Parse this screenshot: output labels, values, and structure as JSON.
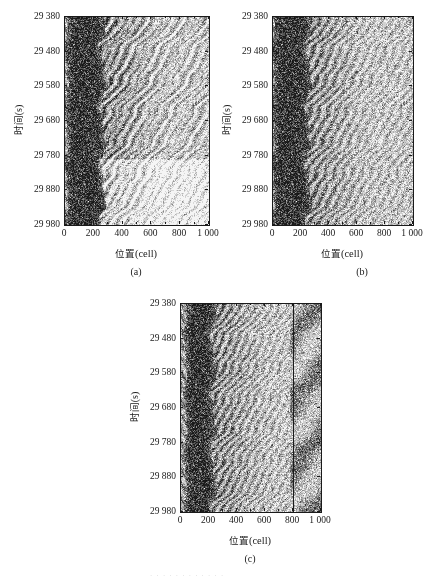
{
  "figure": {
    "panels": [
      {
        "id": "a",
        "caption": "(a)",
        "vline": null
      },
      {
        "id": "b",
        "caption": "(b)",
        "vline": null
      },
      {
        "id": "c",
        "caption": "(c)",
        "vline": 800
      }
    ],
    "axis": {
      "x_title_cn": "位置",
      "x_title_unit": "(cell)",
      "y_title_cn": "时间",
      "y_title_unit": "(s)",
      "x_ticks": [
        "0",
        "200",
        "400",
        "600",
        "800",
        "1 000"
      ],
      "x_tick_values": [
        0,
        200,
        400,
        600,
        800,
        1000
      ],
      "y_ticks": [
        "29 380",
        "29 480",
        "29 580",
        "29 680",
        "29 780",
        "29 880",
        "29 980"
      ],
      "y_tick_values": [
        29380,
        29480,
        29580,
        29680,
        29780,
        29880,
        29980
      ]
    }
  },
  "chart_data": [
    {
      "type": "heatmap",
      "panel": "a",
      "title": "(a)",
      "xlabel": "位置(cell)",
      "ylabel": "时间(s)",
      "xlim": [
        0,
        1000
      ],
      "ylim": [
        29380,
        29980
      ],
      "y_inverted": true,
      "grid": false,
      "legend": "none",
      "colormap": "grayscale",
      "value_meaning": "vehicle occupancy / density (dark = congested jam, light = free flow)",
      "xticks": [
        0,
        200,
        400,
        600,
        800,
        1000
      ],
      "yticks": [
        29380,
        29480,
        29580,
        29680,
        29780,
        29880,
        29980
      ],
      "features": {
        "jam_band_x_range": [
          40,
          260
        ],
        "jam_band_description": "dense dark stop-and-go cluster oscillating between cell 40 and cell 260 over the whole time window",
        "downstream_front_x": 265,
        "wave_direction": "backward-propagating (upstream) jam waves with forward-inclined free-flow stripes downstream",
        "free_flow_region_x_range": [
          300,
          1000
        ],
        "notable_light_bands_t": [
          29560,
          29680,
          29800,
          29880
        ],
        "texture_density_right": "medium-dark speckle above t=29790, light speckle below"
      }
    },
    {
      "type": "heatmap",
      "panel": "b",
      "title": "(b)",
      "xlabel": "位置(cell)",
      "ylabel": "时间(s)",
      "xlim": [
        0,
        1000
      ],
      "ylim": [
        29380,
        29980
      ],
      "y_inverted": true,
      "grid": false,
      "legend": "none",
      "colormap": "grayscale",
      "value_meaning": "vehicle occupancy / density (dark = congested jam, light = free flow)",
      "xticks": [
        0,
        200,
        400,
        600,
        800,
        1000
      ],
      "yticks": [
        29380,
        29480,
        29580,
        29680,
        29780,
        29880,
        29980
      ],
      "features": {
        "jam_band_x_range": [
          30,
          250
        ],
        "jam_band_description": "solid black vertical congestion column from cell 30 to 250 persisting across all times",
        "downstream_front_x": 255,
        "wave_direction": "regular periodic backward waves fanning right from the jam edge",
        "free_flow_region_x_range": [
          300,
          1000
        ],
        "stripe_period_s": 40,
        "texture_density_right": "uniform medium speckle, lighter diagonal stripes every ~40 s"
      }
    },
    {
      "type": "heatmap",
      "panel": "c",
      "title": "(c)",
      "xlabel": "位置(cell)",
      "ylabel": "时间(s)",
      "xlim": [
        0,
        1000
      ],
      "ylim": [
        29380,
        29980
      ],
      "y_inverted": true,
      "grid": false,
      "legend": "none",
      "colormap": "grayscale",
      "value_meaning": "vehicle occupancy / density (dark = congested jam, light = free flow)",
      "xticks": [
        0,
        200,
        400,
        600,
        800,
        1000
      ],
      "yticks": [
        29380,
        29480,
        29580,
        29680,
        29780,
        29880,
        29980
      ],
      "annotations": [
        {
          "type": "vertical-line",
          "x": 800,
          "label": "bottleneck / detector location"
        }
      ],
      "features": {
        "jam_band_x_range": [
          60,
          230
        ],
        "jam_band_description": "broad black jam column between cell 60 and 230 with strong oscillation",
        "downstream_front_x": 240,
        "wave_direction": "dense backward waves fanning out to the right, merging near cell 800",
        "free_flow_region_x_range": [
          820,
          1000
        ],
        "stripe_period_s": 35,
        "texture_density_right": "speckled medium gray right of the cell-800 line"
      }
    }
  ]
}
